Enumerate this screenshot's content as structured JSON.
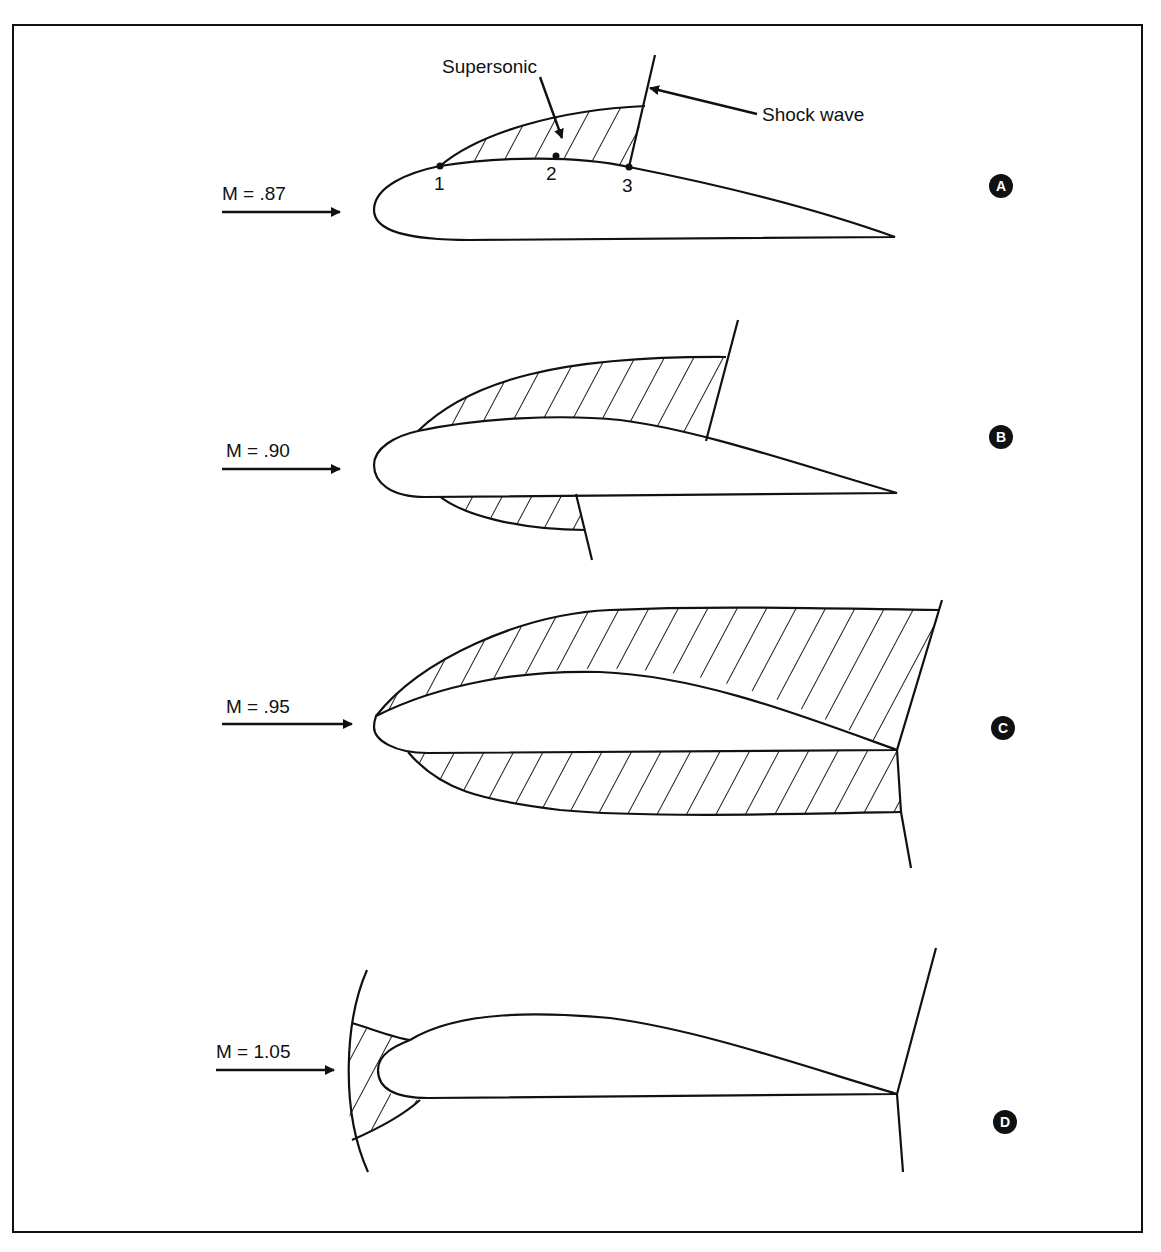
{
  "annotations": {
    "supersonic": "Supersonic",
    "shock_wave": "Shock wave",
    "points": [
      "1",
      "2",
      "3"
    ]
  },
  "panels": [
    {
      "id": "A",
      "badge": "A",
      "mach_label": "M = .87",
      "mach": 0.87,
      "description": "Small supersonic region on upper surface terminated by a shock wave"
    },
    {
      "id": "B",
      "badge": "B",
      "mach_label": "M = .90",
      "mach": 0.9,
      "description": "Larger upper supersonic region; lower-surface supersonic region with shock"
    },
    {
      "id": "C",
      "badge": "C",
      "mach_label": "M = .95",
      "mach": 0.95,
      "description": "Supersonic regions extend to trailing edge on both surfaces; shocks at trailing edge"
    },
    {
      "id": "D",
      "badge": "D",
      "mach_label": "M = 1.05",
      "mach": 1.05,
      "description": "Bow wave ahead of leading edge; trailing edge shocks"
    }
  ],
  "colors": {
    "ink": "#111111",
    "paper": "#ffffff"
  }
}
